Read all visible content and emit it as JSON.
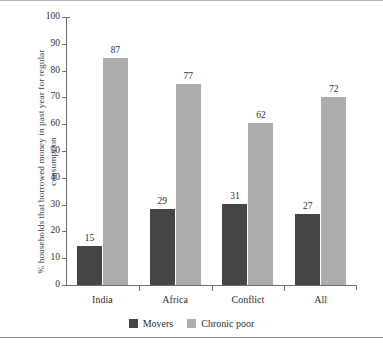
{
  "chart_data": {
    "type": "bar",
    "title": "",
    "subtitle": "",
    "xlabel": "",
    "ylabel": "% households that borrowed money in past year for regular consumption",
    "ylim": [
      0,
      100
    ],
    "yticks": [
      0,
      10,
      20,
      30,
      40,
      50,
      60,
      70,
      80,
      90,
      100
    ],
    "grid": false,
    "legend_position": "bottom-center",
    "categories": [
      "India",
      "Africa",
      "Conflict",
      "All"
    ],
    "series": [
      {
        "name": "Movers",
        "color": "#454545",
        "values": [
          15,
          29,
          31,
          27
        ],
        "labels": [
          "15",
          "29",
          "31",
          "27"
        ]
      },
      {
        "name": "Chronic poor",
        "color": "#adadad",
        "values": [
          87,
          77,
          62,
          72
        ],
        "labels": [
          "87",
          "77",
          "62",
          "72"
        ]
      }
    ]
  },
  "axis": {
    "y_tick_labels": [
      "100",
      "90",
      "80",
      "70",
      "60",
      "50",
      "40",
      "30",
      "20",
      "10",
      "0"
    ],
    "y_title": "% households that borrowed money in past year for regular consumption"
  },
  "legend": {
    "entries": [
      {
        "label": "Movers",
        "color": "#454545"
      },
      {
        "label": "Chronic poor",
        "color": "#adadad"
      }
    ]
  }
}
